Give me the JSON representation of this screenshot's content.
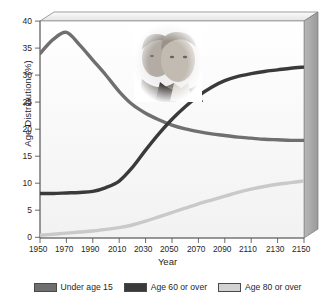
{
  "chart_data": {
    "type": "line",
    "title": "",
    "xlabel": "Year",
    "ylabel": "Age Distribution (%)",
    "xlim": [
      1950,
      2150
    ],
    "ylim": [
      0,
      40
    ],
    "xticks": [
      1950,
      1970,
      1990,
      2010,
      2030,
      2050,
      2070,
      2090,
      2110,
      2130,
      2150
    ],
    "yticks": [
      0,
      5,
      10,
      15,
      20,
      25,
      30,
      35,
      40
    ],
    "grid": false,
    "legend_position": "bottom",
    "x": [
      1950,
      1960,
      1970,
      1980,
      1990,
      2000,
      2010,
      2020,
      2030,
      2040,
      2050,
      2060,
      2070,
      2080,
      2090,
      2100,
      2110,
      2120,
      2130,
      2140,
      2150
    ],
    "series": [
      {
        "name": "Under age 15",
        "color": "#6f6f6f",
        "values": [
          34.0,
          36.6,
          37.9,
          35.6,
          32.8,
          30.0,
          27.0,
          24.6,
          23.0,
          21.8,
          20.8,
          20.1,
          19.6,
          19.2,
          18.9,
          18.6,
          18.4,
          18.2,
          18.1,
          18.0,
          18.0
        ]
      },
      {
        "name": "Age 60 or over",
        "color": "#3a3a3a",
        "values": [
          8.2,
          8.2,
          8.3,
          8.4,
          8.6,
          9.3,
          10.5,
          13.0,
          16.2,
          19.2,
          21.9,
          24.2,
          26.2,
          27.8,
          29.0,
          29.8,
          30.3,
          30.7,
          31.0,
          31.3,
          31.5
        ]
      },
      {
        "name": "Age 80 or over",
        "color": "#c9c9c9",
        "values": [
          0.5,
          0.7,
          0.9,
          1.1,
          1.3,
          1.6,
          1.9,
          2.4,
          3.1,
          3.9,
          4.7,
          5.5,
          6.3,
          7.0,
          7.7,
          8.4,
          9.0,
          9.5,
          9.9,
          10.2,
          10.5
        ]
      }
    ]
  },
  "axes": {
    "y_title": "Age Distribution (%)",
    "x_title": "Year",
    "y_tick_labels": [
      "40",
      "35",
      "30",
      "25",
      "20",
      "15",
      "10",
      "5",
      "0"
    ],
    "x_tick_labels": [
      "1950",
      "1970",
      "1990",
      "2010",
      "2030",
      "2050",
      "2070",
      "2090",
      "2110",
      "2130",
      "2150"
    ]
  },
  "legend": {
    "items": [
      {
        "label": "Under age 15",
        "color": "#6f6f6f"
      },
      {
        "label": "Age 60 or over",
        "color": "#3a3a3a"
      },
      {
        "label": "Age 80 or over",
        "color": "#d2d2d2"
      }
    ]
  },
  "inset_image": {
    "name": "elderly-couple-photo",
    "description": "Grayscale photograph of an elderly couple"
  }
}
